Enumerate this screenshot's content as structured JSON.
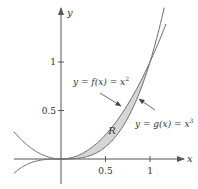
{
  "figure": {
    "axes": {
      "x_label": "x",
      "y_label": "y",
      "x_ticks": [
        {
          "value": 0.5,
          "label": "0.5"
        },
        {
          "value": 1,
          "label": "1"
        }
      ],
      "y_ticks": [
        {
          "value": 0.5,
          "label": "0.5"
        },
        {
          "value": 1,
          "label": "1"
        }
      ]
    },
    "curves": [
      {
        "name": "f",
        "expression": "x^2",
        "label_prefix": "y = f(x) = x",
        "exponent": "2"
      },
      {
        "name": "g",
        "expression": "x^3",
        "label_prefix": "y = g(x) = x",
        "exponent": "3"
      }
    ],
    "region": {
      "label": "R",
      "between": [
        "f",
        "g"
      ],
      "x_from": 0,
      "x_to": 1
    },
    "colors": {
      "curve": "#6b6b6b",
      "axis": "#555555",
      "region_fill": "#d6d6d6",
      "text": "#333333"
    }
  }
}
